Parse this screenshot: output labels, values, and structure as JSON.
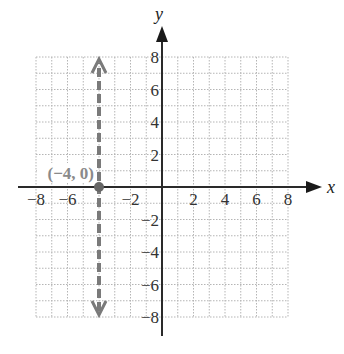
{
  "chart_data": {
    "type": "line",
    "title": "",
    "xlabel": "x",
    "ylabel": "y",
    "xlim": [
      -8,
      8
    ],
    "ylim": [
      -8,
      8
    ],
    "grid": true,
    "grid_step": 1,
    "x_ticks": [
      -8,
      -6,
      -2,
      2,
      4,
      6,
      8
    ],
    "x_tick_labels": [
      "−8",
      "−6",
      "−2",
      "2",
      "4",
      "6",
      "8"
    ],
    "y_ticks": [
      8,
      6,
      4,
      2,
      -2,
      -4,
      -6,
      -8
    ],
    "y_tick_labels": [
      "8",
      "6",
      "4",
      "2",
      "−2",
      "−4",
      "−6",
      "−8"
    ],
    "series": [
      {
        "name": "x = -4",
        "style": "dashed",
        "arrows": "both",
        "color": "#7a7a7a",
        "points": [
          [
            -4,
            -8
          ],
          [
            -4,
            8
          ]
        ]
      }
    ],
    "annotations": [
      {
        "text": "(−4, 0)",
        "x": -4,
        "y": 0,
        "marker": "point",
        "color": "#8a8a8a"
      }
    ],
    "legend": null
  },
  "colors": {
    "grid": "#b5b5b5",
    "axis": "#2a2a2a",
    "line": "#7a7a7a",
    "point_label": "#8a8a8a"
  }
}
